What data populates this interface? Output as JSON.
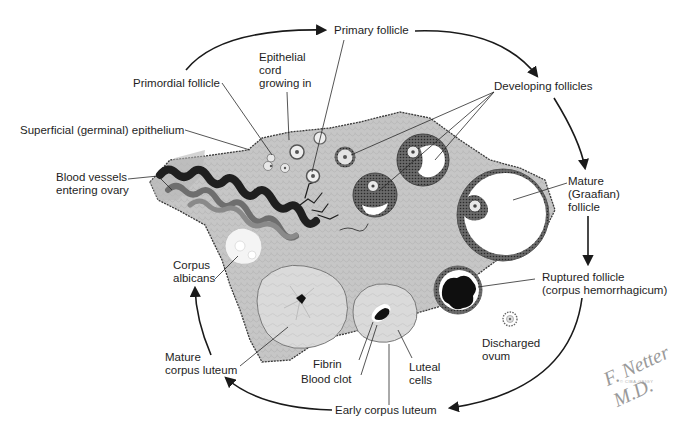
{
  "diagram": {
    "colors": {
      "stroma": "#c9c9c9",
      "stroma_dark": "#a8a8a8",
      "granulosa": "#5a5a5a",
      "antrum": "#ffffff",
      "blood": "#111111",
      "vessel_dark": "#1f1f1f",
      "vessel_light": "#7a7a7a",
      "corpus_luteum": "#dcdcdc",
      "corpus_albicans": "#f4f4f4",
      "text": "#1e1e1e",
      "arrow": "#1a1a1a"
    },
    "labels": {
      "primary_follicle": "Primary follicle",
      "epithelial_cord": "Epithelial\ncord\ngrowing in",
      "primordial_follicle": "Primordial follicle",
      "developing_follicles": "Developing follicles",
      "superficial_epithelium": "Superficial (germinal) epithelium",
      "blood_vessels": "Blood vessels\nentering ovary",
      "mature_graafian": "Mature\n(Graafian)\nfollicle",
      "corpus_albicans": "Corpus\nalbicans",
      "ruptured_follicle": "Ruptured follicle\n(corpus hemorrhagicum)",
      "discharged_ovum": "Discharged\novum",
      "mature_corpus_luteum": "Mature\ncorpus luteum",
      "fibrin": "Fibrin",
      "blood_clot": "Blood clot",
      "luteal_cells": "Luteal\ncells",
      "early_corpus_luteum": "Early corpus luteum"
    },
    "cycle_order": [
      "Primordial follicle",
      "Primary follicle",
      "Developing follicles",
      "Mature (Graafian) follicle",
      "Ruptured follicle (corpus hemorrhagicum)",
      "Early corpus luteum",
      "Mature corpus luteum",
      "Corpus albicans"
    ],
    "signature": {
      "name": "F. Netter M.D.",
      "copyright": "© CIBA-GEIGY"
    }
  }
}
